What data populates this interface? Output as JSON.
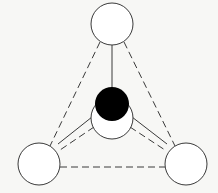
{
  "diagram": {
    "type": "tetrahedral-molecule",
    "colors": {
      "background": "#f7f7f5",
      "stroke": "#3a3a3a",
      "outer_atom_fill": "#ffffff",
      "central_atom_fill": "#000000"
    },
    "atoms": [
      {
        "id": "top",
        "role": "outer",
        "cx": 112,
        "cy": 24,
        "r": 21
      },
      {
        "id": "bottom-left",
        "role": "outer",
        "cx": 39,
        "cy": 164,
        "r": 21
      },
      {
        "id": "bottom-right",
        "role": "outer",
        "cx": 186,
        "cy": 164,
        "r": 21
      },
      {
        "id": "front",
        "role": "outer",
        "cx": 112,
        "cy": 118,
        "r": 21
      },
      {
        "id": "center",
        "role": "central",
        "cx": 112,
        "cy": 105,
        "r": 17
      }
    ],
    "bonds": {
      "solid": [
        "center-top",
        "center-bottom-left",
        "center-bottom-right"
      ],
      "dashed": [
        "top-bottom-left",
        "top-bottom-right",
        "bottom-left-bottom-right",
        "front-bottom-left",
        "front-bottom-right"
      ]
    }
  }
}
